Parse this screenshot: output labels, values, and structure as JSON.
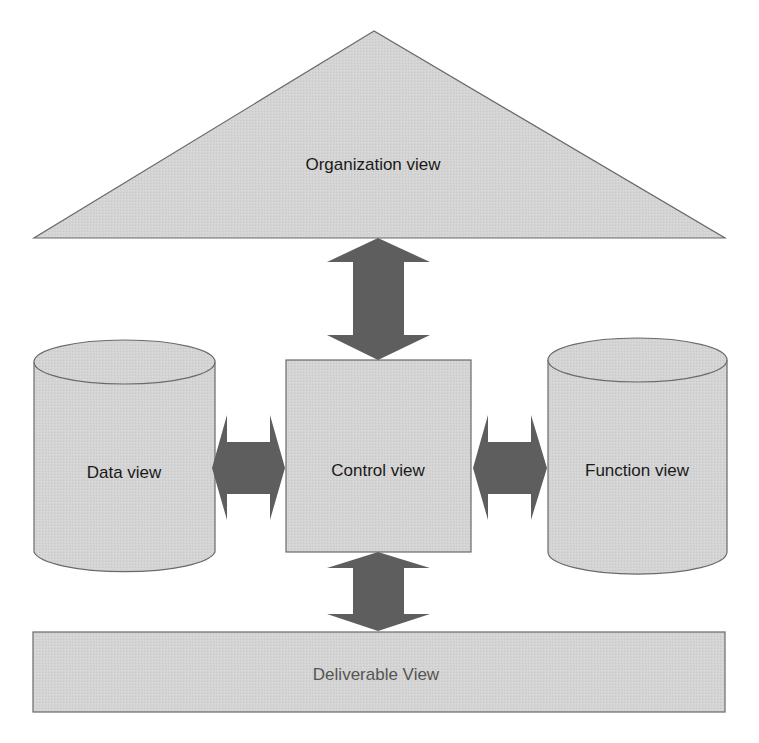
{
  "diagram": {
    "colors": {
      "shape_fill": "#d4d4d4",
      "shape_stroke": "#6a6a6a",
      "arrow_fill": "#5e5e5e",
      "text": "#1a1a1a",
      "text_light": "#555555"
    },
    "nodes": {
      "organization": {
        "label": "Organization view",
        "shape": "triangle"
      },
      "data": {
        "label": "Data view",
        "shape": "cylinder"
      },
      "control": {
        "label": "Control view",
        "shape": "square"
      },
      "function": {
        "label": "Function view",
        "shape": "cylinder"
      },
      "deliverable": {
        "label": "Deliverable View",
        "shape": "rectangle"
      }
    },
    "edges": [
      {
        "from": "organization",
        "to": "control",
        "type": "bidirectional"
      },
      {
        "from": "data",
        "to": "control",
        "type": "bidirectional"
      },
      {
        "from": "control",
        "to": "function",
        "type": "bidirectional"
      },
      {
        "from": "control",
        "to": "deliverable",
        "type": "bidirectional"
      }
    ]
  }
}
